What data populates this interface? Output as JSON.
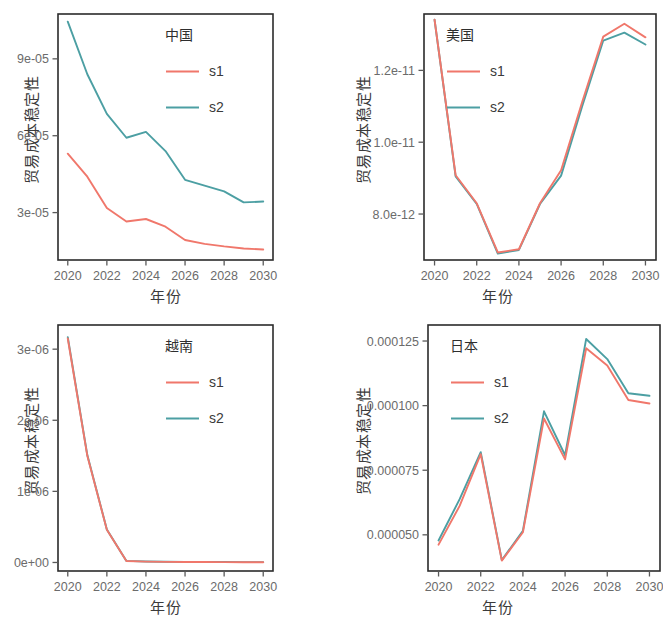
{
  "figure": {
    "axis_titles": {
      "y": "贸易成本稳定性",
      "x": "年份"
    },
    "series_labels": {
      "s1": "s1",
      "s2": "s2"
    },
    "colors": {
      "s1": "#F0776B",
      "s2": "#4C9FA3",
      "frame": "#2b2b2b",
      "tick_text": "#6b6b6b",
      "background": "#ffffff"
    }
  },
  "chart_data": [
    {
      "type": "line",
      "title": "中国",
      "panel": "top-left",
      "xlabel": "年份",
      "ylabel": "贸易成本稳定性",
      "x": [
        2020,
        2021,
        2022,
        2023,
        2024,
        2025,
        2026,
        2027,
        2028,
        2029,
        2030
      ],
      "xticks": [
        2020,
        2022,
        2024,
        2026,
        2028,
        2030
      ],
      "xlim": [
        2019.5,
        2030.5
      ],
      "yticks": [
        3e-05,
        6e-05,
        9e-05
      ],
      "ytick_labels": [
        "3e-05",
        "6e-05",
        "9e-05"
      ],
      "ylim": [
        1.15e-05,
        0.0001075
      ],
      "grid": false,
      "legend_position": "top-right-inside",
      "series": [
        {
          "name": "s1",
          "values": [
            5.3e-05,
            4.4e-05,
            3.18e-05,
            2.65e-05,
            2.75e-05,
            2.45e-05,
            1.93e-05,
            1.78e-05,
            1.68e-05,
            1.6e-05,
            1.56e-05
          ]
        },
        {
          "name": "s2",
          "values": [
            0.0001045,
            8.4e-05,
            6.85e-05,
            5.92e-05,
            6.15e-05,
            5.4e-05,
            4.28e-05,
            4.05e-05,
            3.83e-05,
            3.4e-05,
            3.43e-05
          ]
        }
      ]
    },
    {
      "type": "line",
      "title": "美国",
      "panel": "top-right",
      "xlabel": "年份",
      "ylabel": "贸易成本稳定性",
      "x": [
        2020,
        2021,
        2022,
        2023,
        2024,
        2025,
        2026,
        2027,
        2028,
        2029,
        2030
      ],
      "xticks": [
        2020,
        2022,
        2024,
        2026,
        2028,
        2030
      ],
      "xlim": [
        2019.5,
        2030.5
      ],
      "yticks": [
        8e-12,
        1e-11,
        1.2e-11
      ],
      "ytick_labels": [
        "8.0e-12",
        "1.0e-11",
        "1.2e-11"
      ],
      "ylim": [
        6.72e-12,
        1.357e-11
      ],
      "grid": false,
      "legend_position": "top-left-inside",
      "series": [
        {
          "name": "s1",
          "values": [
            1.341e-11,
            9.08e-12,
            8.3e-12,
            6.93e-12,
            7.02e-12,
            8.3e-12,
            9.22e-12,
            1.112e-11,
            1.294e-11,
            1.33e-11,
            1.292e-11
          ]
        },
        {
          "name": "s2",
          "values": [
            1.341e-11,
            9.05e-12,
            8.28e-12,
            6.9e-12,
            7e-12,
            8.28e-12,
            9.07e-12,
            1.1e-11,
            1.283e-11,
            1.305e-11,
            1.272e-11
          ]
        }
      ]
    },
    {
      "type": "line",
      "title": "越南",
      "panel": "bottom-left",
      "xlabel": "年份",
      "ylabel": "贸易成本稳定性",
      "x": [
        2020,
        2021,
        2022,
        2023,
        2024,
        2025,
        2026,
        2027,
        2028,
        2029,
        2030
      ],
      "xticks": [
        2020,
        2022,
        2024,
        2026,
        2028,
        2030
      ],
      "xlim": [
        2019.5,
        2030.5
      ],
      "yticks": [
        0.0,
        1e-06,
        2e-06,
        3e-06
      ],
      "ytick_labels": [
        "0e+00",
        "1e-06",
        "2e-06",
        "3e-06"
      ],
      "ylim": [
        -1.2e-07,
        3.34e-06
      ],
      "grid": false,
      "legend_position": "top-right-inside",
      "series": [
        {
          "name": "s1",
          "values": [
            3.15e-06,
            1.5e-06,
            4.6e-07,
            2e-08,
            1.2e-08,
            9e-09,
            7e-09,
            6e-09,
            5e-09,
            4e-09,
            4e-09
          ]
        },
        {
          "name": "s2",
          "values": [
            3.17e-06,
            1.51e-06,
            4.65e-07,
            2.2e-08,
            1.4e-08,
            1e-08,
            8e-09,
            7e-09,
            6e-09,
            5e-09,
            5e-09
          ]
        }
      ]
    },
    {
      "type": "line",
      "title": "日本",
      "panel": "bottom-right",
      "xlabel": "年份",
      "ylabel": "贸易成本稳定性",
      "x": [
        2020,
        2021,
        2022,
        2023,
        2024,
        2025,
        2026,
        2027,
        2028,
        2029,
        2030
      ],
      "xticks": [
        2020,
        2022,
        2024,
        2026,
        2028,
        2030
      ],
      "xlim": [
        2019.5,
        2030.5
      ],
      "yticks": [
        5e-05,
        7.5e-05,
        0.0001,
        0.000125
      ],
      "ytick_labels": [
        "0.000050",
        "0.000075",
        "0.000100",
        "0.000125"
      ],
      "ylim": [
        3.6e-05,
        0.0001312
      ],
      "grid": false,
      "legend_position": "top-left-inside",
      "series": [
        {
          "name": "s1",
          "values": [
            4.62e-05,
            6.12e-05,
            8.12e-05,
            4e-05,
            5.1e-05,
            9.5e-05,
            7.92e-05,
            0.0001222,
            0.0001155,
            0.0001022,
            0.0001008
          ]
        },
        {
          "name": "s2",
          "values": [
            4.78e-05,
            6.38e-05,
            8.2e-05,
            4.02e-05,
            5.16e-05,
            9.78e-05,
            8.08e-05,
            0.0001258,
            0.000118,
            0.0001048,
            0.0001038
          ]
        }
      ]
    }
  ]
}
